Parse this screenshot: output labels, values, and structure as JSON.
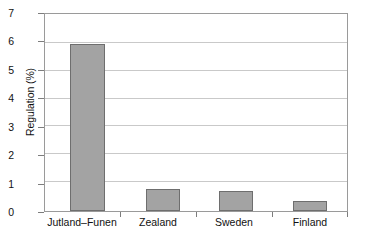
{
  "chart_data": {
    "type": "bar",
    "title": "",
    "xlabel": "",
    "ylabel": "Regulation (%)",
    "categories": [
      "Jutland–Funen",
      "Zealand",
      "Sweden",
      "Finland"
    ],
    "values": [
      6.0,
      0.8,
      0.7,
      0.35
    ],
    "ylim": [
      0,
      7
    ],
    "ytick_labels": [
      "0",
      "1",
      "2",
      "3",
      "4",
      "5",
      "6",
      "7"
    ],
    "ytick_values": [
      0,
      1,
      2,
      3,
      4,
      5,
      6,
      7
    ],
    "grid": "horizontal",
    "legend": "none",
    "bar_fill_color": "#a3a3a3",
    "bar_edge_color": "#6e6e6e",
    "gridline_color": "#c9c9c9",
    "axis_color": "#9a9a9a",
    "background_color": "#ffffff"
  },
  "axis": {
    "y_title": "Regulation (%)",
    "y_ticks": [
      {
        "label": "7",
        "value": 7
      },
      {
        "label": "6",
        "value": 6
      },
      {
        "label": "5",
        "value": 5
      },
      {
        "label": "4",
        "value": 4
      },
      {
        "label": "3",
        "value": 3
      },
      {
        "label": "2",
        "value": 2
      },
      {
        "label": "1",
        "value": 1
      },
      {
        "label": "0",
        "value": 0
      }
    ],
    "x_categories": [
      {
        "label": "Jutland–Funen"
      },
      {
        "label": "Zealand"
      },
      {
        "label": "Sweden"
      },
      {
        "label": "Finland"
      }
    ]
  }
}
